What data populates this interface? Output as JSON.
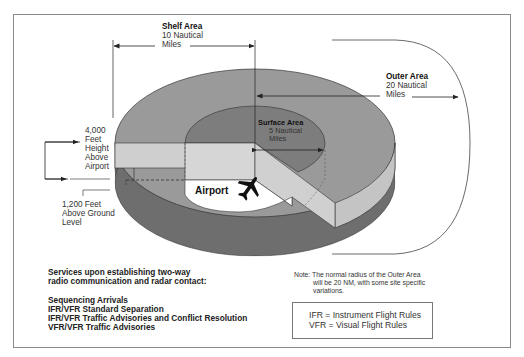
{
  "diagram": {
    "shelf_area": {
      "title": "Shelf Area",
      "line1": "10 Nautical",
      "line2": "Miles"
    },
    "outer_area": {
      "title": "Outer Area",
      "line1": "20 Nautical",
      "line2": "Miles"
    },
    "surface_area": {
      "title": "Surface Area",
      "line1": "5 Nautical",
      "line2": "Miles"
    },
    "height_label": {
      "line1": "4,000",
      "line2": "Feet",
      "line3": "Height",
      "line4": "Above",
      "line5": "Airport"
    },
    "floor_label": {
      "line1": "1,200 Feet",
      "line2": "Above Ground",
      "line3": "Level"
    },
    "airport_label": "Airport",
    "icons": [
      "airplane-icon",
      "arrow-icons"
    ],
    "colors": {
      "shelf_top": "#9a9a9a",
      "surface_top": "#7d7d7d",
      "cut_face": "#cfcfcf",
      "lower_ring": "#6e6e6e",
      "frame": "#8a8a8a"
    }
  },
  "services": {
    "heading_line1": "Services upon establishing two-way",
    "heading_line2": "radio communication and radar contact:",
    "items": [
      "Sequencing Arrivals",
      "IFR/VFR Standard Separation",
      "IFR/VFR Traffic Advisories and Conflict Resolution",
      "VFR/VFR Traffic Advisories"
    ]
  },
  "note": {
    "line1": "Note: The normal radius of the Outer Area",
    "line2": "will be 20 NM, with some site specific",
    "line3": "variations."
  },
  "legend": {
    "ifr": "IFR = Instrument Flight Rules",
    "vfr": "VFR = Visual Flight Rules"
  }
}
